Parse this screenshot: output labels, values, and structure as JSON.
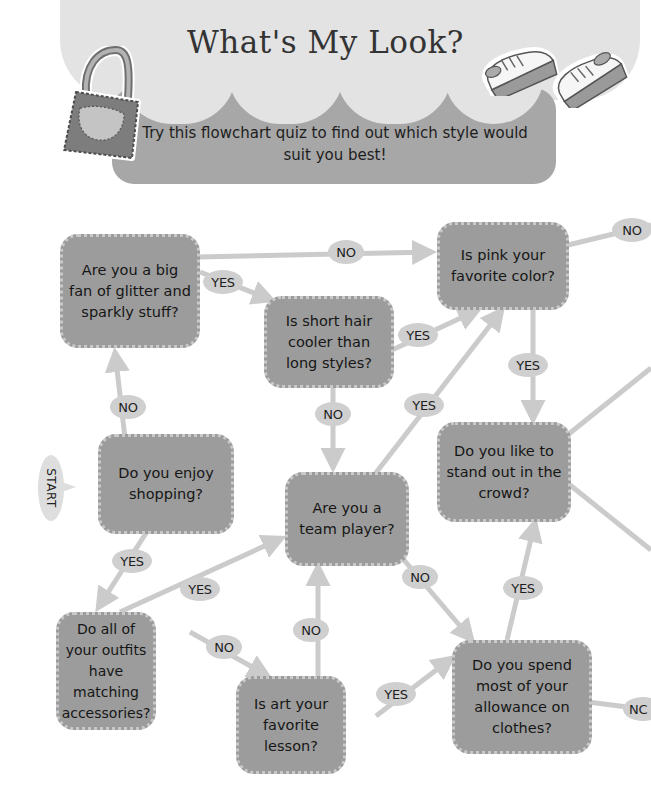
{
  "header": {
    "title": "What's My Look?",
    "subtitle": "Try this flowchart quiz to find out which style would suit you best!",
    "illustrations": [
      "handbag-illustration",
      "sneaker-illustration-left",
      "sneaker-illustration-right"
    ]
  },
  "start": {
    "label": "START"
  },
  "questions": {
    "glitter": "Are you a big fan of glitter and sparkly stuff?",
    "pink": "Is pink your favorite color?",
    "short_hair": "Is short hair cooler than long styles?",
    "shopping": "Do you enjoy shopping?",
    "team_player": "Are you a team player?",
    "stand_out": "Do you like to stand out in the crowd?",
    "matching": "Do all of your outfits have matching accessories?",
    "art": "Is art your favorite lesson?",
    "allowance": "Do you spend most of your allowance on clothes?"
  },
  "answers": {
    "yes": "YES",
    "no": "NO",
    "no_truncated": "NC"
  },
  "edges": [
    {
      "from": "shopping",
      "to": "glitter",
      "label": "NO"
    },
    {
      "from": "shopping",
      "to": "matching",
      "label": "YES"
    },
    {
      "from": "glitter",
      "to": "pink",
      "label": "NO"
    },
    {
      "from": "glitter",
      "to": "short_hair",
      "label": "YES"
    },
    {
      "from": "short_hair",
      "to": "pink",
      "label": "YES"
    },
    {
      "from": "short_hair",
      "to": "team_player",
      "label": "NO"
    },
    {
      "from": "team_player",
      "to": "pink",
      "label": "YES"
    },
    {
      "from": "team_player",
      "to": "allowance",
      "label": "NO"
    },
    {
      "from": "pink",
      "to": "stand_out",
      "label": "YES"
    },
    {
      "from": "pink",
      "to": "off-page-right",
      "label": "NO"
    },
    {
      "from": "matching",
      "to": "team_player",
      "label": "YES"
    },
    {
      "from": "matching",
      "to": "art",
      "label": "NO"
    },
    {
      "from": "art",
      "to": "team_player",
      "label": "NO"
    },
    {
      "from": "art",
      "to": "allowance",
      "label": "YES"
    },
    {
      "from": "allowance",
      "to": "stand_out",
      "label": "YES"
    },
    {
      "from": "allowance",
      "to": "off-page-right",
      "label": "NO"
    },
    {
      "from": "stand_out",
      "to": "off-page-right",
      "label": ""
    },
    {
      "from": "stand_out",
      "to": "off-page-right",
      "label": ""
    }
  ],
  "colors": {
    "node_fill": "#9c9c9c",
    "node_border_dots": "#c9c9c9",
    "arrow": "#cbcbcb",
    "pill": "#cfcfcf",
    "cloud": "#e3e3e3",
    "subtitle_panel": "#a7a7a7",
    "text": "#1e1e1e"
  }
}
